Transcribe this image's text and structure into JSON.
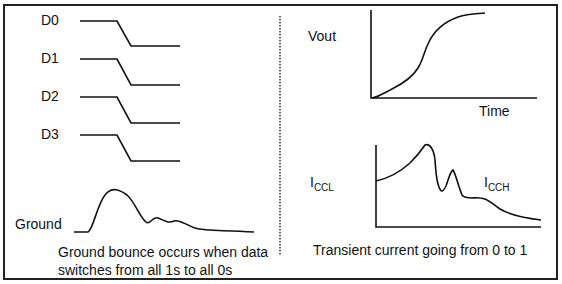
{
  "left_panel": {
    "signals": [
      {
        "label": "D0"
      },
      {
        "label": "D1"
      },
      {
        "label": "D2"
      },
      {
        "label": "D3"
      }
    ],
    "ground_label": "Ground",
    "caption_line1": "Ground bounce occurs when data",
    "caption_line2": "switches from all 1s to all 0s"
  },
  "right_panel": {
    "vout_label": "Vout",
    "time_label": "Time",
    "iccl_main": "I",
    "iccl_sub": "CCL",
    "icch_main": "I",
    "icch_sub": "CCH",
    "caption": "Transient current going from 0 to 1"
  },
  "colors": {
    "line": "#111111",
    "border": "#222222",
    "background": "#ffffff"
  }
}
